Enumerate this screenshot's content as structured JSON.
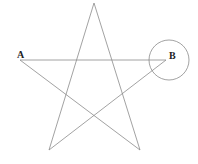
{
  "diagram": {
    "type": "geometry",
    "shape": "pentagram",
    "stroke_color": "#8a8a8a",
    "points": {
      "apex": {
        "x": 94,
        "y": 3
      },
      "bottom_right": {
        "x": 140,
        "y": 150
      },
      "A": {
        "x": 20,
        "y": 60,
        "label": "A"
      },
      "B": {
        "x": 166,
        "y": 60,
        "label": "B"
      },
      "bottom_left": {
        "x": 49,
        "y": 150
      }
    },
    "circle": {
      "cx": 169,
      "cy": 60,
      "r": 20
    },
    "labels": {
      "a": "A",
      "b": "B"
    }
  }
}
